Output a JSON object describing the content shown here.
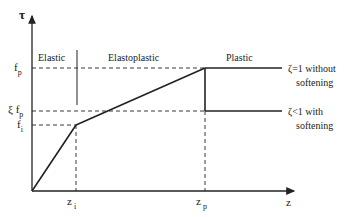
{
  "axes": {
    "y_label": "τ",
    "x_label": "z"
  },
  "y_ticks": {
    "fp": {
      "main": "f",
      "sub": "p"
    },
    "xi_fp": {
      "main": "ξ f",
      "sub": "p"
    },
    "fi": {
      "main": "f",
      "sub": "i"
    }
  },
  "x_ticks": {
    "zi": {
      "main": "z",
      "sub": "i"
    },
    "zp": {
      "main": "z",
      "sub": "p"
    }
  },
  "regions": {
    "elastic": "Elastic",
    "elastoplastic": "Elastoplastic",
    "plastic": "Plastic"
  },
  "annotations": {
    "without_softening_line1": "ζ=1 without",
    "without_softening_line2": "softening",
    "with_softening_line1": "ζ<1 with",
    "with_softening_line2": "softening"
  },
  "colors": {
    "line": "#222222",
    "background": "#ffffff"
  }
}
